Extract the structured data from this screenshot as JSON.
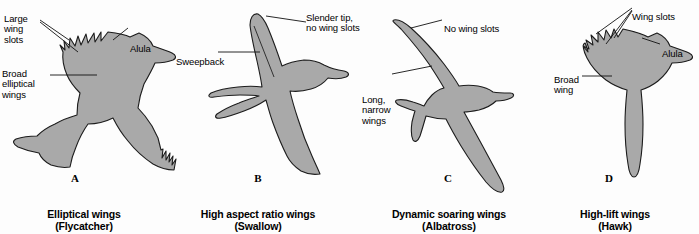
{
  "figure": {
    "background_color": "#fdfdfd",
    "silhouette_fill": "#a9a9a9",
    "silhouette_stroke": "#1c1c1c",
    "text_color": "#000000"
  },
  "panels": [
    {
      "letter": "A",
      "caption": "Elliptical wings\n(Flycatcher)",
      "caption_name": "Elliptical wings",
      "bird": "Flycatcher",
      "labels": [
        {
          "name": "large-wing-slots",
          "text": "Large\nwing\nslots"
        },
        {
          "name": "alula",
          "text": "Alula"
        },
        {
          "name": "broad-elliptical-wings",
          "text": "Broad\nelliptical\nwings"
        }
      ]
    },
    {
      "letter": "B",
      "caption": "High aspect ratio wings\n(Swallow)",
      "caption_name": "High aspect ratio wings",
      "bird": "Swallow",
      "labels": [
        {
          "name": "slender-tip-no-wing-slots",
          "text": "Slender tip,\nno wing slots"
        },
        {
          "name": "sweepback",
          "text": "Sweepback"
        }
      ]
    },
    {
      "letter": "C",
      "caption": "Dynamic soaring wings\n(Albatross)",
      "caption_name": "Dynamic soaring wings",
      "bird": "Albatross",
      "labels": [
        {
          "name": "no-wing-slots",
          "text": "No wing slots"
        },
        {
          "name": "long-narrow-wings",
          "text": "Long,\nnarrow\nwings"
        }
      ]
    },
    {
      "letter": "D",
      "caption": "High-lift wings\n(Hawk)",
      "caption_name": "High-lift wings",
      "bird": "Hawk",
      "labels": [
        {
          "name": "wing-slots",
          "text": "Wing slots"
        },
        {
          "name": "alula",
          "text": "Alula"
        },
        {
          "name": "broad-wing",
          "text": "Broad\nwing"
        }
      ]
    }
  ]
}
